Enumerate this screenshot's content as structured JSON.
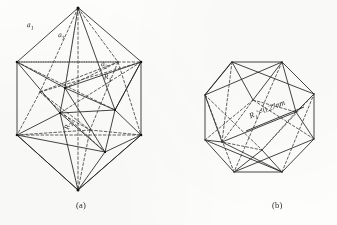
{
  "figure": {
    "panels": [
      {
        "id": "a",
        "caption": "(a)",
        "description": "icosahedral cluster viewed along two-fold axis",
        "labels": [
          {
            "name": "edge-a1",
            "text": "a",
            "sub": "1"
          },
          {
            "name": "edge-a3",
            "text": "a",
            "sub": "3"
          },
          {
            "name": "edge-a2",
            "text": "a",
            "sub": "2"
          },
          {
            "name": "radius-R1",
            "text": "R",
            "sub": "1"
          },
          {
            "name": "radius-R2",
            "text": "R",
            "sub": "2"
          }
        ]
      },
      {
        "id": "b",
        "caption": "(b)",
        "description": "icosahedral cluster viewed along five-fold axis",
        "labels": [
          {
            "name": "radius-R1-prime",
            "text": "R",
            "sub": "1",
            "prime": "'",
            "value": "=0.27nm"
          }
        ]
      }
    ]
  },
  "colors": {
    "ink": "#1f1f1f",
    "page": "#fdfdfc",
    "dashed": "#3a3a3a"
  }
}
